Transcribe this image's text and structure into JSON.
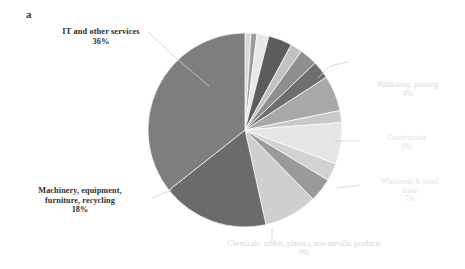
{
  "panel": {
    "letter": "a"
  },
  "chart_data": {
    "type": "pie",
    "title": "",
    "subtitle": "",
    "xlabel": "",
    "ylabel": "",
    "legend_position": "callout-labels",
    "grid": false,
    "units": "percent",
    "center": {
      "x": 245,
      "y": 130
    },
    "radius": 97,
    "start_angle_deg": -90,
    "direction": "clockwise",
    "labels": [
      "IT and other services",
      "Machinery, equipment, furniture, recycling",
      "Chemicals, rubber, plastics, non-metallic products",
      "Wholesale & retail trade",
      "Construction",
      "Publishing, printing"
    ],
    "values": [
      36,
      18,
      9,
      7,
      6,
      4
    ],
    "slices": [
      {
        "name": "unlabeled-1",
        "label": "",
        "pct_text": "",
        "value": 1,
        "color": "#d8d8d8",
        "labeled": false
      },
      {
        "name": "unlabeled-2",
        "label": "",
        "pct_text": "",
        "value": 1,
        "color": "#9c9c9c",
        "labeled": false
      },
      {
        "name": "unlabeled-3",
        "label": "",
        "pct_text": "",
        "value": 2,
        "color": "#e8e8e8",
        "labeled": false
      },
      {
        "name": "publishing-printing",
        "label": "Publishing, printing",
        "pct_text": "4%",
        "value": 4,
        "color": "#5c5c5c",
        "labeled": true
      },
      {
        "name": "unlabeled-4",
        "label": "",
        "pct_text": "",
        "value": 2,
        "color": "#c2c2c2",
        "labeled": false
      },
      {
        "name": "unlabeled-5",
        "label": "",
        "pct_text": "",
        "value": 3,
        "color": "#8f8f8f",
        "labeled": false
      },
      {
        "name": "unlabeled-6",
        "label": "",
        "pct_text": "",
        "value": 3,
        "color": "#6e6e6e",
        "labeled": false
      },
      {
        "name": "construction",
        "label": "Construction",
        "pct_text": "6%",
        "value": 6,
        "color": "#a8a8a8",
        "labeled": true
      },
      {
        "name": "unlabeled-7",
        "label": "",
        "pct_text": "",
        "value": 2,
        "color": "#c9c9c9",
        "labeled": false
      },
      {
        "name": "wholesale-retail-trade",
        "label": "Wholesale & retail trade",
        "pct_text": "7%",
        "value": 7,
        "color": "#e6e6e6",
        "labeled": true
      },
      {
        "name": "unlabeled-8",
        "label": "",
        "pct_text": "",
        "value": 3,
        "color": "#d2d2d2",
        "labeled": false
      },
      {
        "name": "unlabeled-9",
        "label": "",
        "pct_text": "",
        "value": 4,
        "color": "#9a9a9a",
        "labeled": false
      },
      {
        "name": "chemicals-rubber-plastics",
        "label": "Chemicals, rubber, plastics, non-metallic products",
        "pct_text": "9%",
        "value": 9,
        "color": "#cfcfcf",
        "labeled": true
      },
      {
        "name": "machinery-equipment",
        "label": "Machinery, equipment, furniture, recycling",
        "pct_text": "18%",
        "value": 18,
        "color": "#6b6b6b",
        "labeled": true
      },
      {
        "name": "it-and-other-services",
        "label": "IT and other services",
        "pct_text": "36%",
        "value": 36,
        "color": "#7e7e7e",
        "labeled": true
      }
    ],
    "callouts": [
      {
        "name": "it-and-other-services",
        "line1": "IT and other services",
        "line2": "36%",
        "pct": "36%"
      },
      {
        "name": "machinery-equipment",
        "line1": "Machinery, equipment,",
        "line2": "furniture, recycling",
        "line3": "18%",
        "pct": "18%"
      },
      {
        "name": "chemicals-rubber-plastics",
        "line1": "Chemicals, rubber, plastics, non-metallic products",
        "line2": "9%",
        "pct": "9%"
      },
      {
        "name": "wholesale-retail-trade",
        "line1": "Wholesale & retail",
        "line2": "trade",
        "line3": "7%",
        "pct": "7%"
      },
      {
        "name": "construction",
        "line1": "Construction",
        "line2": "6%",
        "pct": "6%"
      },
      {
        "name": "publishing-printing",
        "line1": "Publishing, printing",
        "line2": "4%",
        "pct": "4%"
      }
    ],
    "colors": {
      "background": "#ffffff",
      "leader_line": "#cfcfcf",
      "label_dark": "#2e2e2e",
      "label_faint": "#e0e0e0"
    }
  }
}
